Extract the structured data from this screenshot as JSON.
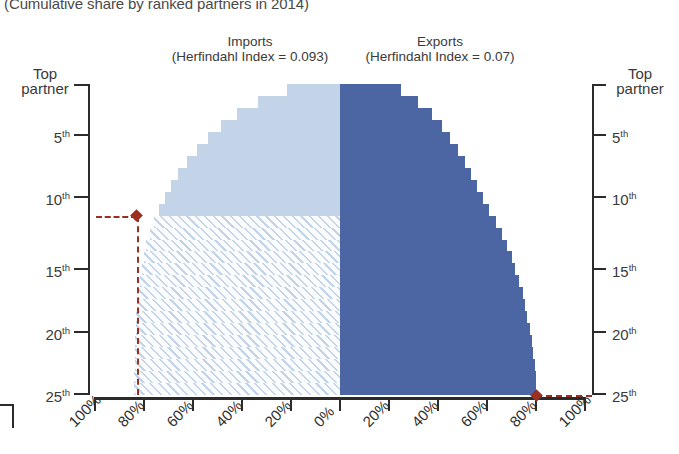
{
  "chart_title": "(Cumulative share by ranked partners in 2014)",
  "panels": {
    "left": {
      "title": "Imports",
      "subtitle": "(Herfindahl Index = 0.093)"
    },
    "right": {
      "title": "Exports",
      "subtitle": "(Herfindahl Index = 0.07)"
    }
  },
  "axes": {
    "y_left_label_top": "Top",
    "y_left_label_bottom": "partner",
    "y_ticks": [
      "5",
      "10",
      "15",
      "20",
      "25"
    ],
    "y_tick_suffix": "th",
    "x_ticks_left": [
      "100%",
      "80%",
      "60%",
      "40%",
      "20%",
      "0%"
    ],
    "x_ticks_right": [
      "20%",
      "40%",
      "60%",
      "80%",
      "100%"
    ]
  },
  "colors": {
    "imports_fill": "#c3d3e8",
    "exports_fill": "#4c65a3",
    "marker": "#9c2f21",
    "axis": "#2b2b2b",
    "text": "#3a3a3a"
  },
  "markers": [
    {
      "name": "imports-threshold",
      "rank": 11,
      "share_percent": 83
    },
    {
      "name": "exports-threshold",
      "rank": 25,
      "share_percent": 80
    }
  ],
  "chart_data": {
    "type": "bar",
    "title": "(Cumulative share by ranked partners in 2014)",
    "xlabel": "",
    "ylabel": "Partner rank",
    "orientation": "horizontal-mirrored",
    "xlim": [
      0,
      100
    ],
    "ylim": [
      1,
      26
    ],
    "grid": false,
    "legend": "none",
    "categories": [
      1,
      2,
      3,
      4,
      5,
      6,
      7,
      8,
      9,
      10,
      11,
      12,
      13,
      14,
      15,
      16,
      17,
      18,
      19,
      20,
      21,
      22,
      23,
      24,
      25,
      26
    ],
    "series": [
      {
        "name": "Imports (Herfindahl Index = 0.093)",
        "side": "left",
        "direction": "right-to-left",
        "axis_labels": [
          "100%",
          "80%",
          "60%",
          "40%",
          "20%",
          "0%"
        ],
        "values": [
          21.5,
          33.5,
          42.0,
          48.5,
          54.0,
          58.5,
          62.5,
          66.0,
          69.0,
          71.5,
          74.0,
          76.0,
          77.5,
          79.0,
          80.0,
          81.0,
          81.8,
          82.4,
          82.9,
          83.2,
          83.4,
          83.6,
          83.7,
          83.8,
          83.9,
          84.0
        ],
        "solid_above_rank": 11,
        "hatched_below_rank": 11
      },
      {
        "name": "Exports (Herfindahl Index = 0.07)",
        "side": "right",
        "direction": "left-to-right",
        "axis_labels": [
          "0%",
          "20%",
          "40%",
          "60%",
          "80%",
          "100%"
        ],
        "values": [
          25.0,
          32.0,
          37.5,
          41.5,
          45.0,
          48.0,
          51.0,
          53.5,
          56.0,
          58.5,
          61.0,
          63.5,
          66.0,
          68.0,
          70.0,
          71.5,
          73.0,
          74.5,
          75.5,
          76.5,
          77.4,
          78.2,
          78.8,
          79.4,
          80.0,
          80.0
        ]
      }
    ],
    "annotations": [
      {
        "text": "Imports threshold at 11th partner",
        "rank": 11,
        "value": 83
      },
      {
        "text": "Exports threshold at 25th partner",
        "rank": 25,
        "value": 80
      }
    ]
  }
}
